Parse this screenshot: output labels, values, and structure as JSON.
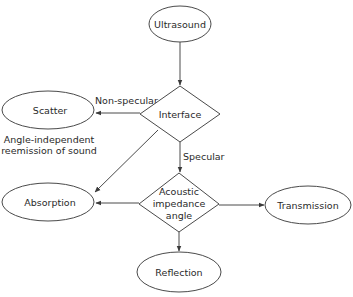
{
  "diagram": {
    "nodes": {
      "ultrasound": {
        "label": "Ultrasound",
        "shape": "ellipse"
      },
      "interface": {
        "label": "Interface",
        "shape": "diamond"
      },
      "scatter": {
        "label": "Scatter",
        "shape": "ellipse"
      },
      "acoustic": {
        "lines": [
          "Acoustic",
          "impedance",
          "angle"
        ],
        "shape": "diamond"
      },
      "absorption": {
        "label": "Absorption",
        "shape": "ellipse"
      },
      "transmission": {
        "label": "Transmission",
        "shape": "ellipse"
      },
      "reflection": {
        "label": "Reflection",
        "shape": "ellipse"
      }
    },
    "edges": {
      "non_specular": {
        "label": "Non-specular",
        "from": "Interface",
        "to": "Scatter"
      },
      "specular": {
        "label": "Specular",
        "from": "Interface",
        "to": "Acoustic impedance angle"
      },
      "ultrasound_interface": {
        "from": "Ultrasound",
        "to": "Interface"
      },
      "interface_absorption": {
        "from": "Interface",
        "to": "Absorption"
      },
      "acoustic_absorption": {
        "from": "Acoustic impedance angle",
        "to": "Absorption"
      },
      "acoustic_transmission": {
        "from": "Acoustic impedance angle",
        "to": "Transmission"
      },
      "acoustic_reflection": {
        "from": "Acoustic impedance angle",
        "to": "Reflection"
      }
    },
    "annotation": {
      "lines": [
        "Angle-independent",
        "reemission of sound"
      ]
    }
  }
}
